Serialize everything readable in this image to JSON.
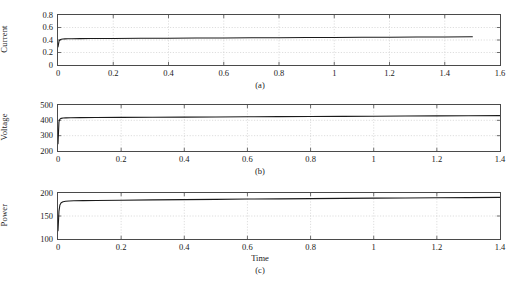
{
  "figure": {
    "title": "",
    "background": "#ffffff",
    "axis_color": "#4a4a4a",
    "grid_color": "#c8c8c8",
    "line_color": "#1a1a1a"
  },
  "chart_data": [
    {
      "type": "line",
      "panel": "(a)",
      "title": "",
      "xlabel": "",
      "ylabel": "Current",
      "xlim": [
        0,
        1.6
      ],
      "ylim": [
        0,
        0.8
      ],
      "xticks": [
        0,
        0.2,
        0.4,
        0.6,
        0.8,
        1,
        1.2,
        1.4,
        1.6
      ],
      "xticklabels": [
        "0",
        "0.2",
        "0.4",
        "0.6",
        "0.8",
        "1",
        "1.2",
        "1.4",
        "1.6"
      ],
      "yticks": [
        0,
        0.2,
        0.4,
        0.6,
        0.8
      ],
      "yticklabels": [
        "0",
        "0.2",
        "0.4",
        "0.6",
        "0.8"
      ],
      "grid": true,
      "legend": "none",
      "series": [
        {
          "name": "Current",
          "color": "#1a1a1a",
          "x": [
            0,
            0.004,
            0.008,
            0.012,
            0.018,
            0.025,
            0.035,
            0.05,
            0.08,
            0.12,
            0.2,
            0.3,
            0.4,
            0.5,
            0.6,
            0.7,
            0.8,
            0.9,
            1.0,
            1.1,
            1.2,
            1.3,
            1.4,
            1.5
          ],
          "y": [
            0.29,
            0.385,
            0.405,
            0.412,
            0.416,
            0.418,
            0.42,
            0.421,
            0.422,
            0.423,
            0.425,
            0.427,
            0.429,
            0.431,
            0.433,
            0.435,
            0.437,
            0.439,
            0.441,
            0.443,
            0.445,
            0.447,
            0.449,
            0.451
          ]
        }
      ]
    },
    {
      "type": "line",
      "panel": "(b)",
      "title": "",
      "xlabel": "",
      "ylabel": "Voltage",
      "xlim": [
        0,
        1.4
      ],
      "ylim": [
        200,
        500
      ],
      "xticks": [
        0,
        0.2,
        0.4,
        0.6,
        0.8,
        1,
        1.2,
        1.4
      ],
      "xticklabels": [
        "0",
        "0.2",
        "0.4",
        "0.6",
        "0.8",
        "1",
        "1.2",
        "1.4"
      ],
      "yticks": [
        200,
        300,
        400,
        500
      ],
      "yticklabels": [
        "200",
        "300",
        "400",
        "500"
      ],
      "grid": true,
      "legend": "none",
      "series": [
        {
          "name": "Voltage",
          "color": "#1a1a1a",
          "x": [
            0,
            0.003,
            0.006,
            0.01,
            0.016,
            0.025,
            0.04,
            0.07,
            0.12,
            0.2,
            0.3,
            0.4,
            0.5,
            0.6,
            0.7,
            0.8,
            0.9,
            1.0,
            1.1,
            1.2,
            1.3,
            1.4
          ],
          "y": [
            248,
            390,
            408,
            413,
            415,
            416,
            417,
            417.5,
            418,
            419,
            420,
            421,
            422,
            423,
            424,
            425,
            426,
            427,
            428,
            429,
            430,
            431
          ]
        }
      ]
    },
    {
      "type": "line",
      "panel": "(c)",
      "title": "",
      "xlabel": "Time",
      "ylabel": "Power",
      "xlim": [
        0,
        1.4
      ],
      "ylim": [
        100,
        200
      ],
      "xticks": [
        0,
        0.2,
        0.4,
        0.6,
        0.8,
        1,
        1.2,
        1.4
      ],
      "xticklabels": [
        "0",
        "0.2",
        "0.4",
        "0.6",
        "0.8",
        "1",
        "1.2",
        "1.4"
      ],
      "yticks": [
        100,
        150,
        200
      ],
      "yticklabels": [
        "100",
        "150",
        "200"
      ],
      "grid": true,
      "legend": "none",
      "series": [
        {
          "name": "Power",
          "color": "#1a1a1a",
          "x": [
            0,
            0.003,
            0.006,
            0.01,
            0.016,
            0.024,
            0.035,
            0.05,
            0.08,
            0.12,
            0.2,
            0.3,
            0.4,
            0.5,
            0.6,
            0.7,
            0.8,
            0.9,
            1.0,
            1.1,
            1.2,
            1.3,
            1.4
          ],
          "y": [
            118,
            160,
            174,
            179,
            181,
            182,
            182.6,
            183,
            183.4,
            183.8,
            184.4,
            185,
            185.6,
            186.2,
            186.8,
            187.3,
            187.8,
            188.3,
            188.8,
            189.2,
            189.6,
            190,
            190.4
          ]
        }
      ]
    }
  ]
}
